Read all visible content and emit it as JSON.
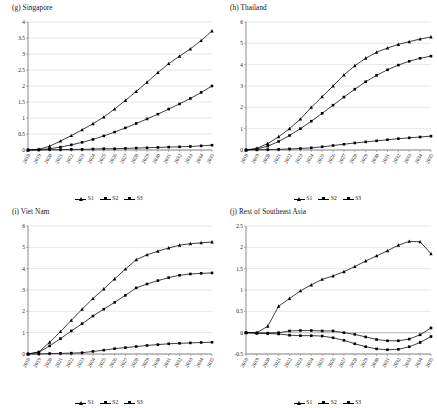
{
  "figure": {
    "background": "#ffffff",
    "series_color": "#000000",
    "gridline_color": "#cfcfcf",
    "axis_color": "#808080"
  },
  "legend": {
    "entries": [
      {
        "label": "S1",
        "marker": "triangle"
      },
      {
        "label": "S2",
        "marker": "square"
      },
      {
        "label": "S3",
        "marker": "square"
      }
    ]
  },
  "chart_data": [
    {
      "type": "line",
      "title": "(g) Singapore",
      "panel": "g",
      "xlabel": "",
      "ylabel": "",
      "grid": true,
      "legend_position": "bottom",
      "ylim": [
        0,
        4
      ],
      "yticks": [
        0,
        0.5,
        1,
        1.5,
        2,
        2.5,
        3,
        3.5,
        4
      ],
      "ytick_labels": [
        "0",
        "0.5",
        "1",
        "1.5",
        "2",
        "2.5",
        "3",
        "3.5",
        "4"
      ],
      "x": [
        "2018",
        "2019",
        "2020",
        "2021",
        "2022",
        "2023",
        "2024",
        "2025",
        "2026",
        "2027",
        "2028",
        "2029",
        "2030",
        "2031",
        "2032",
        "2033",
        "2034",
        "2035"
      ],
      "series": [
        {
          "name": "S1",
          "values": [
            0,
            0.02,
            0.12,
            0.28,
            0.45,
            0.63,
            0.82,
            1.03,
            1.28,
            1.55,
            1.83,
            2.12,
            2.42,
            2.7,
            2.93,
            3.16,
            3.42,
            3.72
          ]
        },
        {
          "name": "S2",
          "values": [
            0,
            0.01,
            0.04,
            0.09,
            0.16,
            0.24,
            0.33,
            0.44,
            0.56,
            0.69,
            0.83,
            0.97,
            1.12,
            1.28,
            1.44,
            1.61,
            1.8,
            2.0
          ]
        },
        {
          "name": "S3",
          "values": [
            0,
            0.0,
            0.01,
            0.01,
            0.02,
            0.02,
            0.03,
            0.04,
            0.04,
            0.05,
            0.06,
            0.07,
            0.08,
            0.09,
            0.1,
            0.11,
            0.13,
            0.15
          ]
        }
      ]
    },
    {
      "type": "line",
      "title": "(h) Thailand",
      "panel": "h",
      "xlabel": "",
      "ylabel": "",
      "grid": true,
      "legend_position": "bottom",
      "ylim": [
        0,
        6
      ],
      "yticks": [
        0,
        1,
        2,
        3,
        4,
        5,
        6
      ],
      "ytick_labels": [
        "0",
        "1",
        "2",
        "3",
        "4",
        "5",
        "6"
      ],
      "x": [
        "2018",
        "2019",
        "2020",
        "2021",
        "2022",
        "2023",
        "2024",
        "2025",
        "2026",
        "2027",
        "2028",
        "2029",
        "2030",
        "2031",
        "2032",
        "2033",
        "2034",
        "2035"
      ],
      "series": [
        {
          "name": "S1",
          "values": [
            0,
            0.08,
            0.3,
            0.62,
            1.0,
            1.45,
            2.0,
            2.5,
            3.0,
            3.52,
            3.95,
            4.3,
            4.58,
            4.78,
            4.95,
            5.08,
            5.2,
            5.3
          ]
        },
        {
          "name": "S2",
          "values": [
            0,
            0.05,
            0.18,
            0.4,
            0.68,
            1.0,
            1.35,
            1.72,
            2.1,
            2.48,
            2.85,
            3.2,
            3.5,
            3.76,
            3.98,
            4.16,
            4.3,
            4.4
          ]
        },
        {
          "name": "S3",
          "values": [
            0,
            0.01,
            0.02,
            0.03,
            0.05,
            0.07,
            0.1,
            0.15,
            0.21,
            0.27,
            0.33,
            0.38,
            0.43,
            0.48,
            0.53,
            0.57,
            0.61,
            0.65
          ]
        }
      ]
    },
    {
      "type": "line",
      "title": "(i) Viet Nam",
      "panel": "i",
      "xlabel": "",
      "ylabel": "",
      "grid": true,
      "legend_position": "bottom",
      "ylim": [
        0,
        6
      ],
      "yticks": [
        0,
        1,
        2,
        3,
        4,
        5,
        6
      ],
      "ytick_labels": [
        "0",
        "1",
        "2",
        "3",
        "4",
        "5",
        "6"
      ],
      "x": [
        "2018",
        "2019",
        "2020",
        "2021",
        "2022",
        "2023",
        "2024",
        "2025",
        "2026",
        "2027",
        "2028",
        "2029",
        "2030",
        "2031",
        "2032",
        "2033",
        "2034",
        "2035"
      ],
      "series": [
        {
          "name": "S1",
          "values": [
            0,
            0.1,
            0.55,
            1.05,
            1.58,
            2.1,
            2.6,
            3.05,
            3.52,
            3.98,
            4.42,
            4.65,
            4.82,
            4.97,
            5.1,
            5.17,
            5.21,
            5.25
          ]
        },
        {
          "name": "S2",
          "values": [
            0,
            0.08,
            0.38,
            0.72,
            1.08,
            1.42,
            1.78,
            2.1,
            2.42,
            2.75,
            3.1,
            3.28,
            3.44,
            3.58,
            3.69,
            3.75,
            3.78,
            3.8
          ]
        },
        {
          "name": "S3",
          "values": [
            0,
            0.0,
            0.02,
            0.03,
            0.04,
            0.06,
            0.12,
            0.18,
            0.25,
            0.3,
            0.35,
            0.4,
            0.44,
            0.48,
            0.5,
            0.52,
            0.54,
            0.55
          ]
        }
      ]
    },
    {
      "type": "line",
      "title": "(j) Rest of Southeast Asia",
      "panel": "j",
      "xlabel": "",
      "ylabel": "",
      "grid": true,
      "legend_position": "bottom",
      "ylim": [
        -0.5,
        2.5
      ],
      "yticks": [
        -0.5,
        0,
        0.5,
        1,
        1.5,
        2,
        2.5
      ],
      "ytick_labels": [
        "-0.5",
        "0",
        "0.5",
        "1",
        "1.5",
        "2",
        "2.5"
      ],
      "x": [
        "2018",
        "2019",
        "2020",
        "2021",
        "2022",
        "2023",
        "2024",
        "2025",
        "2026",
        "2027",
        "2028",
        "2029",
        "2030",
        "2031",
        "2032",
        "2033",
        "2034",
        "2035"
      ],
      "series": [
        {
          "name": "S1",
          "values": [
            0,
            0.0,
            0.15,
            0.62,
            0.8,
            0.98,
            1.12,
            1.25,
            1.33,
            1.43,
            1.55,
            1.68,
            1.8,
            1.92,
            2.05,
            2.14,
            2.13,
            1.85
          ]
        },
        {
          "name": "S2",
          "values": [
            0,
            -0.01,
            -0.01,
            0.0,
            0.04,
            0.05,
            0.05,
            0.04,
            0.04,
            0.0,
            -0.04,
            -0.1,
            -0.16,
            -0.19,
            -0.19,
            -0.15,
            -0.05,
            0.11
          ]
        },
        {
          "name": "S3",
          "values": [
            0,
            -0.01,
            -0.02,
            -0.03,
            -0.06,
            -0.07,
            -0.07,
            -0.08,
            -0.12,
            -0.18,
            -0.26,
            -0.33,
            -0.38,
            -0.4,
            -0.39,
            -0.33,
            -0.23,
            -0.09
          ]
        }
      ]
    }
  ]
}
